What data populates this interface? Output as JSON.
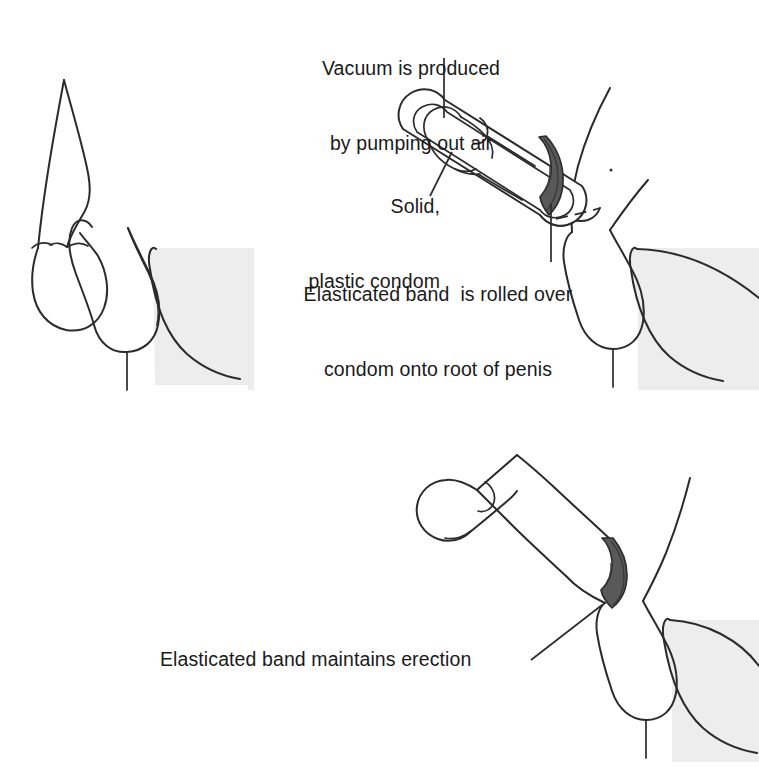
{
  "figure": {
    "background_color": "#ffffff",
    "line_color": "#2b2b2b",
    "band_color": "#595959",
    "band_shadow_color": "#4a4a4a",
    "thigh_fill_color": "#ededed",
    "text_color": "#1a1a1a"
  },
  "annotations": {
    "vacuum": {
      "line1": "Vacuum is produced",
      "line2": "by pumping out air"
    },
    "condom": {
      "line1": "Solid,",
      "line2": "plastic condom"
    },
    "band_rolled": {
      "line1": "Elasticated band  is rolled over",
      "line2": "condom onto root of penis"
    },
    "band_maintains": {
      "line1": "Elasticated band maintains erection"
    }
  },
  "panels": {
    "flaccid": {
      "name": "Flaccid penis before treatment",
      "position": "top-left"
    },
    "device": {
      "name": "Penis inside vacuum condom with elasticated band",
      "position": "top-right"
    },
    "erect": {
      "name": "Erect penis with elasticated band at root",
      "position": "bottom-right"
    }
  }
}
